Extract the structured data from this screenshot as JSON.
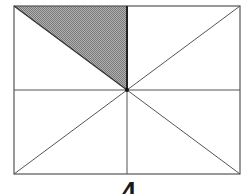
{
  "diagram": {
    "type": "rectangle-divided-into-8-triangles",
    "rect": {
      "x1": 14,
      "y1": 6,
      "x2": 240,
      "y2": 174
    },
    "center": {
      "x": 127,
      "y": 90
    },
    "shaded_region": "top-left triangle between top-left corner, top-middle point and center",
    "colors": {
      "stroke": "#333333",
      "shade": "#9a9a9a",
      "background": "#ffffff"
    },
    "total_parts": 8,
    "shaded_parts": 1
  },
  "caption": {
    "label": "4"
  }
}
